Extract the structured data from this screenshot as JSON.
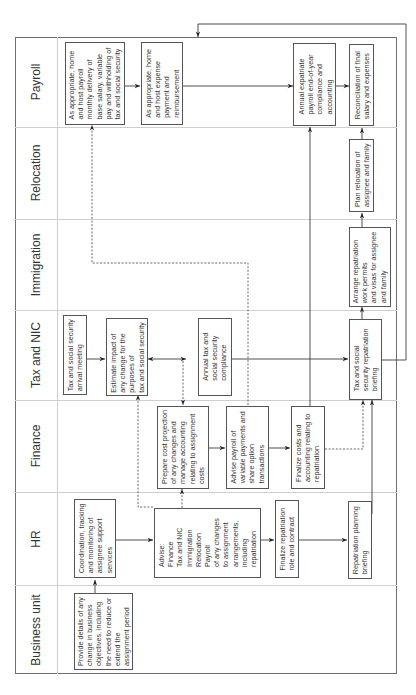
{
  "lanes": [
    {
      "id": "payroll",
      "label": "Payroll"
    },
    {
      "id": "relocation",
      "label": "Relocation"
    },
    {
      "id": "immigration",
      "label": "Immigration"
    },
    {
      "id": "tax",
      "label": "Tax and NIC"
    },
    {
      "id": "finance",
      "label": "Finance"
    },
    {
      "id": "hr",
      "label": "HR"
    },
    {
      "id": "business",
      "label": "Business unit"
    }
  ],
  "boxes": {
    "payroll_monthly": "As appropriate, home\nand host payroll\nmonthly delivery of\nbase salary, variable\npay and withholding of\ntax and social security",
    "payroll_expense": "As appropriate, home\nand host expense\npayment and\nreimbursement",
    "payroll_annual": "Annual expatriate\npayroll end-of-year\ncompliance and\naccounting",
    "payroll_reconciliation": "Reconciliation of final\nsalary and expenses",
    "relocation_plan": "Plan relocation of\nassignee and family",
    "immigration_arrange": "Arrange repatriation\nwork permits\nand visas for assignee\nand family",
    "tax_arrival": "Tax and social security\narrival meeting",
    "tax_estimate": "Estimate impact of\nany change for the\npurposes of\ntax and social security",
    "tax_annual": "Annual tax and\nsocial security\ncompliance",
    "tax_repatriation": "Tax and social\nsecurity repatriation\nbriefing",
    "finance_cost": "Prepare cost projection\nof any changes and\nmanage accounting\nrelating to assignment\ncosts",
    "finance_payroll": "Advise payroll of\nvariable payments and\nshare option\ntransactions",
    "finance_finalize": "Finalize costs and\naccounting relating to\nrepatriation",
    "hr_coordination": "Coordination, tracking\nand monitoring of\nassignee support\nservices",
    "hr_advise": "Advise:\nFinance\nTax and NIC\nImmigration\nRelocation\nPayroll\nof any changes\nto assignment\narrangements,\nincluding\nrepatriation",
    "hr_finalize": "Finalize repatriation\nrole and contract",
    "hr_briefing": "Repatriation planning\nbriefing",
    "business_details": "Provide details of any\nchange in business\nobjectives, including\nthe need to reduce or\nextend the\nassignment period"
  },
  "colors": {
    "line": "#3a3a3a",
    "box_border": "#555555",
    "lane_separator": "#cfcfcf",
    "frame": "#6e6e6e"
  }
}
